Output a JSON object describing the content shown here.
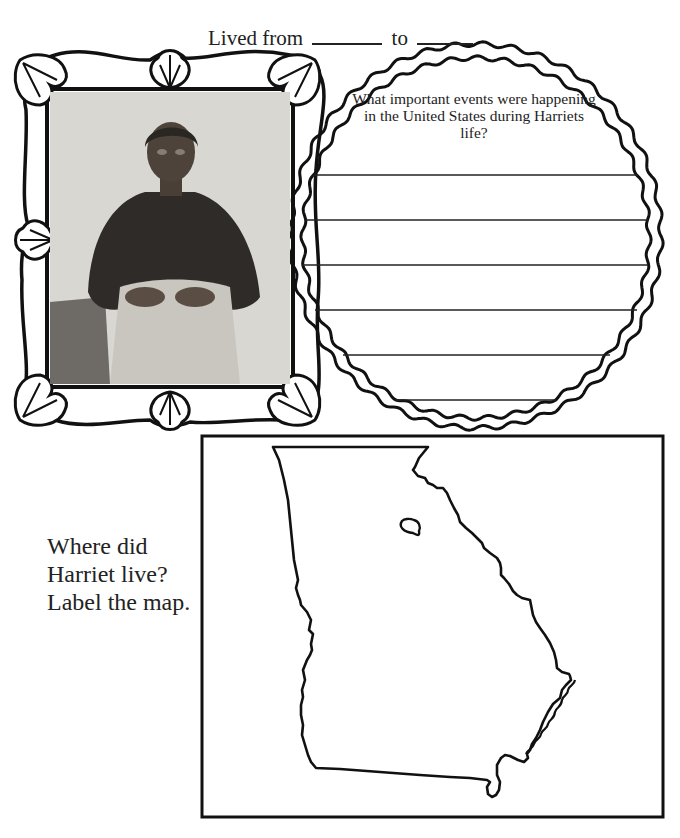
{
  "header": {
    "lived_from_label": "Lived from",
    "to_label": "to"
  },
  "portrait": {
    "description": "Historic black-and-white photograph of Harriet, seated woman in dark dress with apron"
  },
  "events_circle": {
    "question": "What important events were happening in the United States during Harriets life?",
    "answer_lines": [
      "",
      "",
      "",
      "",
      "",
      ""
    ]
  },
  "map_section": {
    "prompt": "Where did Harriet live? Label the map.",
    "map_subject": "Georgia state outline"
  },
  "colors": {
    "ink": "#222222",
    "paper": "#ffffff",
    "photo_bg": "#d6d5d0"
  }
}
